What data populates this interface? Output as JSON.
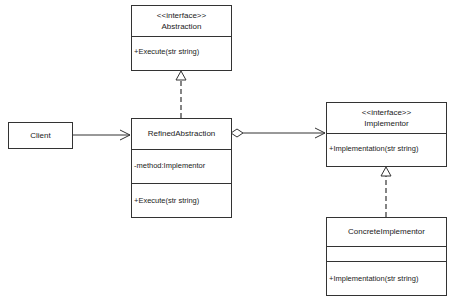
{
  "diagram": {
    "type": "UML class diagram",
    "nodes": {
      "abstraction": {
        "stereotype": "<<interface>>",
        "name": "Abstraction",
        "attributes": [],
        "methods": [
          "+Execute(str string)"
        ]
      },
      "client": {
        "name": "Client"
      },
      "refined_abstraction": {
        "name": "RefinedAbstraction",
        "attributes": [
          "-method:Implementor"
        ],
        "methods": [
          "+Execute(str string)"
        ]
      },
      "implementor": {
        "stereotype": "<<interface>>",
        "name": "Implementor",
        "attributes": [],
        "methods": [
          "+Implementation(str string)"
        ]
      },
      "concrete_implementor": {
        "name": "ConcreteImplementor",
        "attributes": [],
        "methods": [
          "+Implementation(str string)"
        ]
      }
    },
    "edges": [
      {
        "from": "client",
        "to": "refined_abstraction",
        "kind": "association"
      },
      {
        "from": "refined_abstraction",
        "to": "abstraction",
        "kind": "realization"
      },
      {
        "from": "refined_abstraction",
        "to": "implementor",
        "kind": "aggregation"
      },
      {
        "from": "concrete_implementor",
        "to": "implementor",
        "kind": "realization"
      }
    ],
    "colors": {
      "line": "#333333",
      "fill": "#ffffff",
      "text": "#222222"
    }
  }
}
